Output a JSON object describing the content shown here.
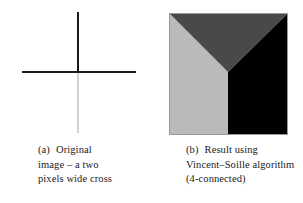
{
  "figure": {
    "panel_a": {
      "name": "original-cross-image",
      "caption": {
        "tag": "(a)",
        "lines": [
          "Original",
          "image – a two",
          "pixels wide cross"
        ],
        "full_text": "(a) Original image – a two pixels wide cross"
      },
      "drawing": {
        "type": "cross",
        "description": "two pixels wide cross",
        "vertical_upper_color": "#1a1a1a",
        "vertical_lower_color": "#d2d2d2",
        "horizontal_color": "#1a1a1a",
        "stroke_width_px": 2,
        "intersection_x": 78,
        "intersection_y": 72
      }
    },
    "panel_b": {
      "name": "vincent-soille-result-image",
      "caption": {
        "tag": "(b)",
        "lines": [
          "Result using",
          "Vincent–Soille algorithm",
          "(4-connected)"
        ],
        "full_text": "(b) Result using Vincent–Soille algorithm (4-connected)"
      },
      "drawing": {
        "type": "watershed-regions",
        "region_count": 3,
        "regions": [
          {
            "label": "left-region",
            "color": "#bcbcbc",
            "tone": "light gray"
          },
          {
            "label": "top-region",
            "color": "#4a4a4a",
            "tone": "dark gray"
          },
          {
            "label": "right-region",
            "color": "#050505",
            "tone": "black"
          }
        ],
        "border_color": "#9a9a9a",
        "triple_junction_x": 228,
        "triple_junction_y": 72
      }
    }
  },
  "page": {
    "background_color": "#ffffff",
    "text_color": "#1a1a1a"
  }
}
